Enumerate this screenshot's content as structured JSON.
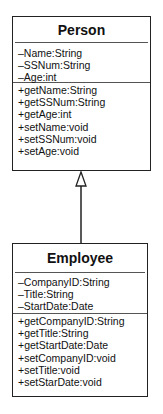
{
  "classes": {
    "person": {
      "name": "Person",
      "attributes": [
        "–Name:String",
        "–SSNum:String",
        "–Age:int"
      ],
      "methods": [
        "+getName:String",
        "+getSSNum:String",
        "+getAge:int",
        "+setName:void",
        "+setSSNum:void",
        "+setAge:void"
      ]
    },
    "employee": {
      "name": "Employee",
      "attributes": [
        "–CompanyID:String",
        "–Title:String",
        "–StartDate:Date"
      ],
      "methods": [
        "+getCompanyID:String",
        "+getTitle:String",
        "+getStartDate:Date",
        "+setCompanyID:void",
        "+setTitle:void",
        "+setStarDate:void"
      ]
    }
  },
  "relationships": [
    {
      "type": "generalization",
      "from": "Employee",
      "to": "Person"
    }
  ]
}
